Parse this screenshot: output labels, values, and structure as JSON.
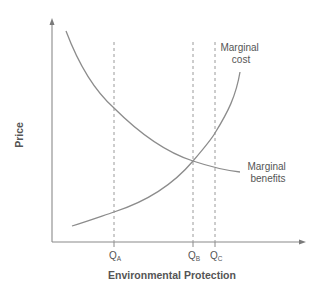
{
  "diagram": {
    "title": "",
    "x_axis_label": "Environmental Protection",
    "y_axis_label": "Price",
    "curves": [
      {
        "name": "Marginal cost",
        "label_line1": "Marginal",
        "label_line2": "cost",
        "shape": "increasing, convex"
      },
      {
        "name": "Marginal benefits",
        "label_line1": "Marginal",
        "label_line2": "benefits",
        "shape": "decreasing, convex"
      }
    ],
    "quantities": [
      {
        "label": "Q",
        "subscript": "A",
        "meaning": "MB > MC"
      },
      {
        "label": "Q",
        "subscript": "B",
        "meaning": "MB = MC (efficient level)"
      },
      {
        "label": "Q",
        "subscript": "C",
        "meaning": "MC > MB"
      }
    ],
    "colors": {
      "curves": "#8c8c8c",
      "axes": "#8a8a8a",
      "text": "#555555",
      "background": "#ffffff"
    }
  }
}
